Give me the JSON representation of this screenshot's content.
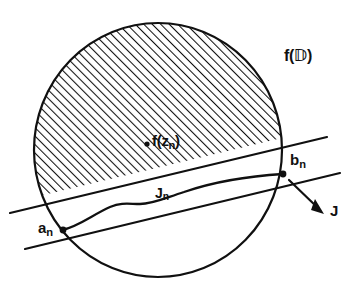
{
  "figure": {
    "kind": "mathematical-diagram",
    "background_color": "#ffffff",
    "ink_color": "#101010",
    "hatch": {
      "style": "diagonal-lines",
      "angle_deg": 45,
      "spacing_px": 6,
      "stroke_width_px": 2.1,
      "color": "#101010"
    },
    "disk": {
      "center_x": 158,
      "center_y": 150,
      "radius_x": 125,
      "radius_y": 128,
      "stroke_width_px": 2.2,
      "label": "f(D)"
    },
    "labels": {
      "disk_image": {
        "base": "f(",
        "symbol": "D",
        "close": ")"
      },
      "point_image": {
        "base": "f(z",
        "sub": "n",
        "close": ")"
      },
      "endpoint_right": {
        "base": "b",
        "sub": "n"
      },
      "endpoint_left": {
        "base": "a",
        "sub": "n"
      },
      "arc": {
        "base": "J",
        "sub": "n"
      },
      "arrow_target": {
        "base": "J"
      }
    },
    "markers": [
      {
        "name": "f(z_n)",
        "x": 147,
        "y": 144,
        "r": 2.6
      },
      {
        "name": "b_n",
        "x": 283,
        "y": 174,
        "r": 3.4
      },
      {
        "name": "a_n",
        "x": 62,
        "y": 230,
        "r": 3.4
      }
    ],
    "line_upper": {
      "x1": 10,
      "y1": 213,
      "x2": 327,
      "y2": 137,
      "stroke_width_px": 2.2
    },
    "line_lower": {
      "x1": 25,
      "y1": 249,
      "x2": 340,
      "y2": 173,
      "stroke_width_px": 2.2
    },
    "arc_jn": {
      "from": "a_n",
      "to": "b_n",
      "path": "M 62,230 C 80,226 94,214 112,206 C 124,201 130,203 140,203 C 152,203 164,198 182,192 C 215,181 250,176 283,174",
      "stroke_width_px": 2.3
    },
    "arrow_j": {
      "x1": 289,
      "y1": 180,
      "x2": 322,
      "y2": 212,
      "stroke_width_px": 2.2,
      "head_length_px": 10
    }
  }
}
